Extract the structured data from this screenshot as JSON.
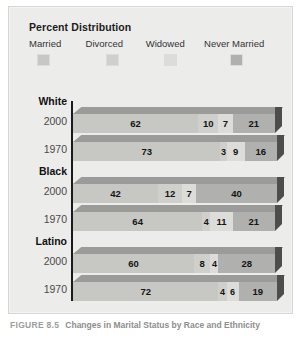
{
  "figure": {
    "caption_number": "FIGURE 8.5",
    "caption_title": "Changes in Marital Status by Race and Ethnicity"
  },
  "legend": {
    "title": "Percent Distribution",
    "items": [
      {
        "label": "Married",
        "color": "#c7c7c4"
      },
      {
        "label": "Divorced",
        "color": "#cfcfcc"
      },
      {
        "label": "Widowed",
        "color": "#dcdcd9"
      },
      {
        "label": "Never Married",
        "color": "#b0b0ae"
      }
    ]
  },
  "chart_data": {
    "type": "bar",
    "title": "Percent Distribution",
    "subtype": "stacked-horizontal-3d",
    "xlabel": "",
    "ylabel": "",
    "xlim": [
      0,
      100
    ],
    "grid": false,
    "legend_position": "top",
    "categories": [
      "Married",
      "Divorced",
      "Widowed",
      "Never Married"
    ],
    "groups": [
      {
        "name": "White",
        "rows": [
          {
            "year": "2000",
            "values": [
              62,
              10,
              7,
              21
            ]
          },
          {
            "year": "1970",
            "values": [
              73,
              3,
              9,
              16
            ]
          }
        ]
      },
      {
        "name": "Black",
        "rows": [
          {
            "year": "2000",
            "values": [
              42,
              12,
              7,
              40
            ]
          },
          {
            "year": "1970",
            "values": [
              64,
              4,
              11,
              21
            ]
          }
        ]
      },
      {
        "name": "Latino",
        "rows": [
          {
            "year": "2000",
            "values": [
              60,
              8,
              4,
              28
            ]
          },
          {
            "year": "1970",
            "values": [
              72,
              4,
              6,
              19
            ]
          }
        ]
      }
    ]
  }
}
